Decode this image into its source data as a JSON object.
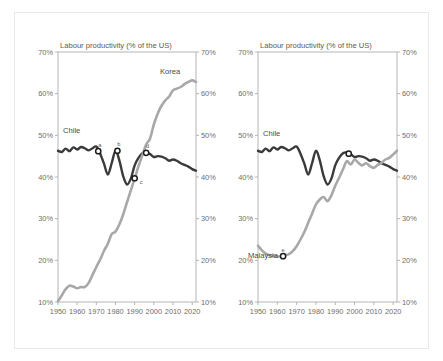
{
  "figure": {
    "panels": [
      {
        "id": "left",
        "axis_title": "Labour productivity (% of the US)",
        "y_ticks": [
          "10%",
          "20%",
          "30%",
          "40%",
          "50%",
          "60%",
          "70%"
        ],
        "x_ticks": [
          "1950",
          "1960",
          "1970",
          "1980",
          "1990",
          "2000",
          "2010",
          "2020"
        ],
        "series_labels": [
          {
            "name": "Chile",
            "text": "Chile"
          },
          {
            "name": "Korea",
            "text": "Korea"
          }
        ],
        "point_labels": [
          "a",
          "b",
          "c",
          "d"
        ]
      },
      {
        "id": "right",
        "axis_title": "Labour productivity (% of the US)",
        "y_ticks": [
          "10%",
          "20%",
          "30%",
          "40%",
          "50%",
          "60%",
          "70%"
        ],
        "x_ticks": [
          "1950",
          "1960",
          "1970",
          "1980",
          "1990",
          "2000",
          "2010",
          "2020"
        ],
        "series_labels": [
          {
            "name": "Chile",
            "text": "Chile"
          },
          {
            "name": "Malaysia",
            "text": "Malaysia"
          }
        ],
        "point_labels": [
          "e"
        ]
      }
    ]
  },
  "colors": {
    "chile": "#3a3a3a",
    "korea": "#a8a8a8",
    "malaysia": "#a8a8a8",
    "axis": "#b5b5b5",
    "tick_text": "#6e6e6e",
    "frame": "#e9e9e9"
  },
  "chart_data": [
    {
      "type": "line",
      "panel": "left",
      "title": "Labour productivity (% of the US)",
      "xlabel": "",
      "ylabel": "Labour productivity (% of the US)",
      "xlim": [
        1950,
        2022
      ],
      "ylim": [
        10,
        70
      ],
      "grid": false,
      "legend": "inline-labels",
      "x": [
        1950,
        1952,
        1954,
        1956,
        1958,
        1960,
        1962,
        1964,
        1966,
        1968,
        1970,
        1972,
        1974,
        1976,
        1978,
        1980,
        1982,
        1984,
        1986,
        1988,
        1990,
        1992,
        1994,
        1996,
        1998,
        2000,
        2002,
        2004,
        2006,
        2008,
        2010,
        2012,
        2014,
        2016,
        2018,
        2020,
        2022
      ],
      "series": [
        {
          "name": "Chile",
          "color": "#3a3a3a",
          "values": [
            46.3,
            46.0,
            46.8,
            46.2,
            47.1,
            46.6,
            47.2,
            46.9,
            46.4,
            46.9,
            47.3,
            45.6,
            43.2,
            40.6,
            43.3,
            46.3,
            44.0,
            40.2,
            38.2,
            39.6,
            42.8,
            44.6,
            45.7,
            45.9,
            45.5,
            44.8,
            45.0,
            44.9,
            44.5,
            43.9,
            44.2,
            43.9,
            43.3,
            42.9,
            42.5,
            41.9,
            41.5
          ]
        },
        {
          "name": "Korea",
          "color": "#a8a8a8",
          "values": [
            10.2,
            11.6,
            13.1,
            13.9,
            13.7,
            13.3,
            13.6,
            13.6,
            14.6,
            16.5,
            18.4,
            20.2,
            22.3,
            24.0,
            26.3,
            26.9,
            28.6,
            31.0,
            33.9,
            36.8,
            39.6,
            42.6,
            45.2,
            47.8,
            49.2,
            52.6,
            55.2,
            57.1,
            58.4,
            59.3,
            60.8,
            61.2,
            61.6,
            62.3,
            62.8,
            63.2,
            62.8
          ]
        }
      ],
      "annotations": [
        {
          "label": "a",
          "series": "Chile",
          "x": 1971,
          "y": 46.2
        },
        {
          "label": "b",
          "series": "Chile",
          "x": 1981,
          "y": 46.3
        },
        {
          "label": "c",
          "series": "Chile",
          "x": 1990,
          "y": 39.7
        },
        {
          "label": "d",
          "series": "Chile",
          "x": 1996,
          "y": 45.8
        }
      ]
    },
    {
      "type": "line",
      "panel": "right",
      "title": "Labour productivity (% of the US)",
      "xlabel": "",
      "ylabel": "Labour productivity (% of the US)",
      "xlim": [
        1950,
        2022
      ],
      "ylim": [
        10,
        70
      ],
      "grid": false,
      "legend": "inline-labels",
      "x": [
        1950,
        1952,
        1954,
        1956,
        1958,
        1960,
        1962,
        1964,
        1966,
        1968,
        1970,
        1972,
        1974,
        1976,
        1978,
        1980,
        1982,
        1984,
        1986,
        1988,
        1990,
        1992,
        1994,
        1996,
        1998,
        2000,
        2002,
        2004,
        2006,
        2008,
        2010,
        2012,
        2014,
        2016,
        2018,
        2020,
        2022
      ],
      "series": [
        {
          "name": "Chile",
          "color": "#3a3a3a",
          "values": [
            46.3,
            46.0,
            46.8,
            46.2,
            47.1,
            46.6,
            47.2,
            46.9,
            46.4,
            46.9,
            47.3,
            45.6,
            43.2,
            40.6,
            43.3,
            46.3,
            44.0,
            40.2,
            38.2,
            39.6,
            42.8,
            44.6,
            45.7,
            45.9,
            45.5,
            44.8,
            45.0,
            44.9,
            44.5,
            43.9,
            44.2,
            43.9,
            43.3,
            42.9,
            42.5,
            41.9,
            41.5
          ]
        },
        {
          "name": "Malaysia",
          "color": "#a8a8a8",
          "values": [
            23.5,
            22.4,
            21.6,
            21.2,
            21.1,
            20.9,
            21.0,
            21.2,
            21.5,
            22.2,
            23.4,
            25.0,
            26.8,
            29.0,
            31.2,
            33.4,
            34.6,
            35.2,
            34.2,
            35.6,
            37.9,
            39.8,
            41.8,
            43.8,
            43.0,
            44.2,
            43.4,
            42.8,
            43.3,
            42.6,
            42.2,
            42.9,
            43.4,
            44.2,
            44.6,
            45.4,
            46.3
          ]
        }
      ],
      "annotations": [
        {
          "label": "e",
          "series": "Malaysia",
          "x": 1963,
          "y": 21.0
        },
        {
          "label": "",
          "series": "Chile",
          "x": 1997,
          "y": 45.6
        }
      ]
    }
  ]
}
